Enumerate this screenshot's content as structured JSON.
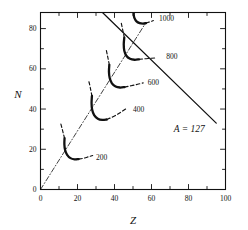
{
  "figure": {
    "background": "#ffffff",
    "ink": "#111111"
  },
  "axes": {
    "xlabel": "Z",
    "ylabel": "N",
    "xlim": [
      0,
      100
    ],
    "ylim": [
      0,
      88
    ],
    "xticks": [
      0,
      20,
      40,
      60,
      80,
      100
    ],
    "yticks": [
      0,
      20,
      40,
      60,
      80
    ],
    "xtick_labels": [
      "0",
      "20",
      "40",
      "60",
      "80",
      "100"
    ],
    "ytick_labels": [
      "0",
      "20",
      "40",
      "60",
      "80"
    ],
    "x_minor_step": 10,
    "y_minor_step": 10,
    "frame": true,
    "grid": false,
    "tick_direction": "in"
  },
  "annotations": {
    "mass_line": "A  =  127"
  },
  "chart_data": {
    "type": "line",
    "title": "",
    "xlabel": "Z",
    "ylabel": "N",
    "xlim": [
      0,
      100
    ],
    "ylim": [
      0,
      88
    ],
    "grid": false,
    "legend": "none",
    "annotations": [
      {
        "text": "A  =  127",
        "x": 72,
        "y": 30,
        "style": "italic-serif"
      }
    ],
    "series": [
      {
        "name": "200",
        "label": "200",
        "label_xy": [
          30,
          16
        ],
        "style": "solid-thick-hook",
        "hook_points": [
          [
            13.0,
            25.5
          ],
          [
            12.9,
            22.5
          ],
          [
            13.3,
            19.6
          ],
          [
            14.4,
            17.2
          ],
          [
            16.2,
            15.6
          ],
          [
            18.4,
            15.0
          ],
          [
            20.6,
            15.1
          ]
        ],
        "dashed_tail_up": [
          [
            13.0,
            25.5
          ],
          [
            12.3,
            28.0
          ],
          [
            11.6,
            30.5
          ],
          [
            11.0,
            32.6
          ]
        ],
        "dashed_tail_right": [
          [
            20.6,
            15.1
          ],
          [
            23.5,
            15.6
          ],
          [
            26.0,
            16.3
          ],
          [
            28.2,
            16.9
          ]
        ]
      },
      {
        "name": "400",
        "label": "400",
        "label_xy": [
          50,
          40
        ],
        "style": "solid-thick-hook",
        "hook_points": [
          [
            27.8,
            46.5
          ],
          [
            27.6,
            43.0
          ],
          [
            27.9,
            39.8
          ],
          [
            29.0,
            37.0
          ],
          [
            31.0,
            35.2
          ],
          [
            33.4,
            34.6
          ],
          [
            35.8,
            34.8
          ]
        ],
        "dashed_tail_up": [
          [
            27.8,
            46.5
          ],
          [
            27.2,
            49.3
          ],
          [
            26.6,
            52.0
          ],
          [
            26.0,
            54.2
          ]
        ],
        "dashed_tail_right": [
          [
            35.8,
            34.8
          ],
          [
            39.5,
            36.3
          ],
          [
            43.0,
            38.2
          ],
          [
            46.0,
            40.0
          ]
        ]
      },
      {
        "name": "600",
        "label": "600",
        "label_xy": [
          58,
          53
        ],
        "style": "solid-thick-hook",
        "hook_points": [
          [
            37.2,
            62.0
          ],
          [
            37.0,
            58.6
          ],
          [
            37.4,
            55.4
          ],
          [
            38.6,
            52.8
          ],
          [
            40.6,
            51.2
          ],
          [
            43.0,
            50.7
          ],
          [
            45.4,
            50.9
          ]
        ],
        "dashed_tail_up": [
          [
            37.2,
            62.0
          ],
          [
            36.6,
            64.8
          ],
          [
            36.0,
            67.4
          ],
          [
            35.5,
            69.6
          ]
        ],
        "dashed_tail_right": [
          [
            45.4,
            50.9
          ],
          [
            49.0,
            51.6
          ],
          [
            52.5,
            52.3
          ],
          [
            55.5,
            53.0
          ]
        ]
      },
      {
        "name": "800",
        "label": "800",
        "label_xy": [
          68,
          66
        ],
        "style": "solid-thick-hook",
        "hook_points": [
          [
            45.3,
            75.5
          ],
          [
            45.0,
            72.2
          ],
          [
            45.3,
            69.0
          ],
          [
            46.4,
            66.5
          ],
          [
            48.4,
            65.0
          ],
          [
            50.8,
            64.5
          ],
          [
            53.2,
            64.7
          ]
        ],
        "dashed_tail_up": [
          [
            45.3,
            75.5
          ],
          [
            44.7,
            78.2
          ],
          [
            44.1,
            80.8
          ],
          [
            43.6,
            83.0
          ]
        ],
        "dashed_tail_right": [
          [
            53.2,
            64.7
          ],
          [
            56.3,
            65.0
          ],
          [
            59.2,
            65.2
          ],
          [
            61.8,
            65.4
          ]
        ]
      },
      {
        "name": "1000",
        "label": "1000",
        "label_xy": [
          64,
          85
        ],
        "style": "solid-thick-hook",
        "hook_points": [
          [
            50.6,
            89.0
          ],
          [
            50.4,
            87.0
          ],
          [
            50.8,
            85.2
          ],
          [
            51.9,
            83.6
          ],
          [
            53.6,
            82.7
          ],
          [
            55.4,
            82.5
          ],
          [
            57.0,
            82.7
          ]
        ],
        "dashed_tail_up": [],
        "dashed_tail_right": [
          [
            57.0,
            82.7
          ],
          [
            58.6,
            83.2
          ],
          [
            60.0,
            83.6
          ],
          [
            61.0,
            84.0
          ]
        ]
      },
      {
        "name": "stability-valley",
        "label": "",
        "style": "dash-dot-thin",
        "points": [
          [
            0,
            0
          ],
          [
            57,
            83
          ]
        ]
      },
      {
        "name": "A=127-line",
        "label": "A  =  127",
        "style": "solid-thin-straight",
        "points": [
          [
            33.5,
            88
          ],
          [
            95.0,
            33.0
          ]
        ]
      }
    ]
  }
}
